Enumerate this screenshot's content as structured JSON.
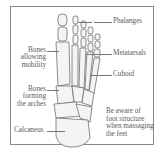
{
  "diagram": {
    "labels": {
      "phalanges": "Phalanges",
      "metatarsals": "Metatarsals",
      "cuboid": "Cuboid",
      "bones_mobility": [
        "Bones",
        "allowing",
        "mobility"
      ],
      "bones_arches": [
        "Bones",
        "forming",
        "the arches"
      ],
      "calcaneus": "Calcaneus"
    },
    "note": [
      "Be aware of",
      "foot structure",
      "when massaging",
      "the feet"
    ]
  }
}
